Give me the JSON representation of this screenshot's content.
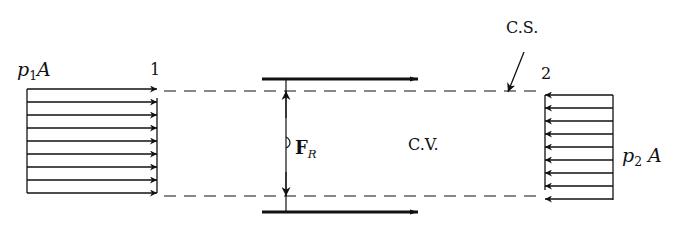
{
  "diagram": {
    "labels": {
      "p1A": {
        "var": "p",
        "sub": "1",
        "rest": "A"
      },
      "p2A": {
        "var": "p",
        "sub": "2",
        "rest": "A"
      },
      "section1": "1",
      "section2": "2",
      "control_surface": "C.S.",
      "control_volume": "C.V.",
      "force": {
        "var": "F",
        "sub": "R"
      }
    },
    "colors": {
      "ink": "#111111",
      "background": "#ffffff"
    },
    "left_pressure_arrows": {
      "count": 9,
      "direction": "right"
    },
    "right_pressure_arrows": {
      "count": 9,
      "direction": "left"
    },
    "shear_arrows": {
      "count": 2,
      "direction": "right"
    }
  }
}
